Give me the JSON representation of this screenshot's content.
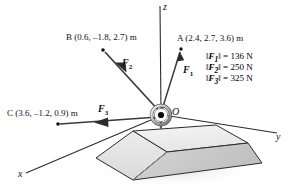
{
  "figure": {
    "background_color": "#ffffff"
  },
  "axes": {
    "x_label": "x",
    "y_label": "y",
    "z_label": "z"
  },
  "origin": {
    "label": "O",
    "icon": "eyebolt-ring-icon"
  },
  "points": [
    {
      "id": "A",
      "label": "A (2.4, 2.7, 3.6) m",
      "name": "A",
      "coords": [
        2.4,
        2.7,
        3.6
      ],
      "unit": "m"
    },
    {
      "id": "B",
      "label": "B (0.6, –1.8, 2.7) m",
      "name": "B",
      "coords": [
        0.6,
        -1.8,
        2.7
      ],
      "unit": "m"
    },
    {
      "id": "C",
      "label": "C (3.6, –1.2, 0.9) m",
      "name": "C",
      "coords": [
        3.6,
        -1.2,
        0.9
      ],
      "unit": "m"
    }
  ],
  "forces": [
    {
      "id": "F1",
      "label": "F",
      "sub": "1",
      "target_point": "A"
    },
    {
      "id": "F2",
      "label": "F",
      "sub": "2",
      "target_point": "B"
    },
    {
      "id": "F3",
      "label": "F",
      "sub": "3",
      "target_point": "C"
    }
  ],
  "legend": [
    {
      "symbol": "F",
      "sub": "1",
      "value": "136",
      "unit": "N",
      "equals": "=",
      "text": "‖F1‖ = 136 N"
    },
    {
      "symbol": "F",
      "sub": "2",
      "value": "250",
      "unit": "N",
      "equals": "=",
      "text": "‖F2‖ = 250 N"
    },
    {
      "symbol": "F",
      "sub": "3",
      "value": "325",
      "unit": "N",
      "equals": "=",
      "text": "‖F3‖ = 325 N"
    }
  ],
  "block": {
    "name": "concrete-pedestal",
    "top_face_color": "#efefef",
    "front_face_color": "#e2e2e2",
    "right_face_color": "#c9c9c9",
    "outline_color": "#2b2b2b",
    "shadow_color": "#d8d8d8"
  },
  "colors": {
    "line": "#2b2b2b",
    "arrow": "#3a3a3a",
    "text": "#111111"
  }
}
